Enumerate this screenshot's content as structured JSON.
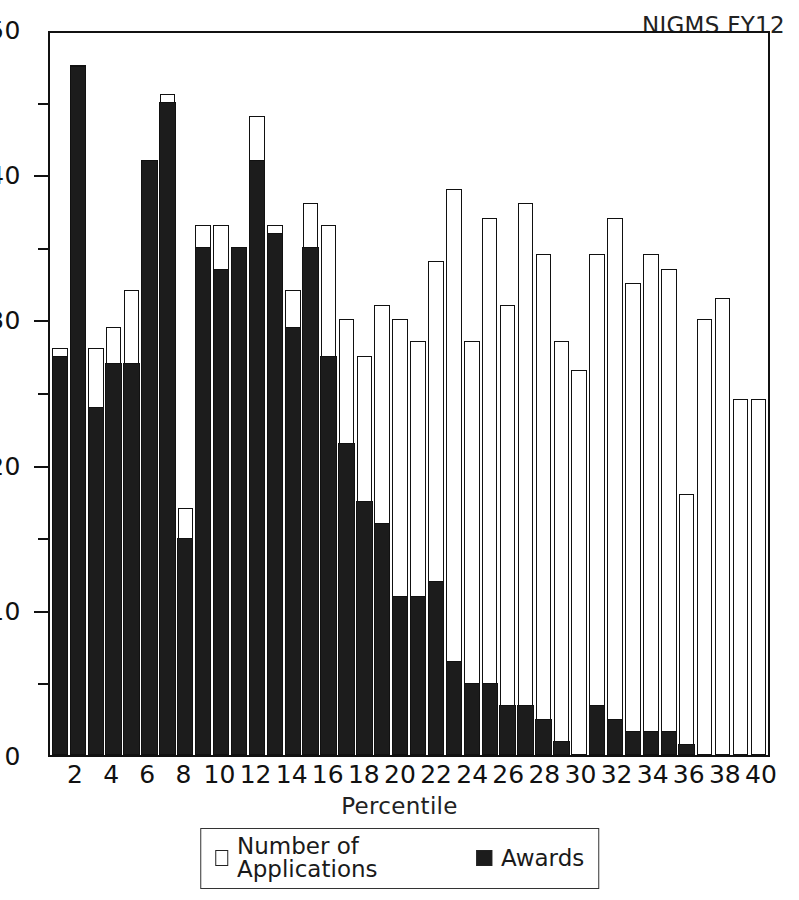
{
  "chart_data": {
    "type": "bar",
    "title": "NIGMS FY12",
    "xlabel": "Percentile",
    "ylabel": "",
    "ylim": [
      0,
      50
    ],
    "yticks": [
      0,
      10,
      20,
      30,
      40,
      50
    ],
    "yticks_minor": [
      5,
      15,
      25,
      35,
      45
    ],
    "grid": false,
    "stacked": true,
    "legend_position": "bottom",
    "xtick_labels": [
      "2",
      "4",
      "6",
      "8",
      "10",
      "12",
      "14",
      "16",
      "18",
      "20",
      "22",
      "24",
      "26",
      "28",
      "30",
      "32",
      "34",
      "36",
      "38",
      "40"
    ],
    "categories": [
      1,
      2,
      3,
      4,
      5,
      6,
      7,
      8,
      9,
      10,
      11,
      12,
      13,
      14,
      15,
      16,
      17,
      18,
      19,
      20,
      21,
      22,
      23,
      24,
      25,
      26,
      27,
      28,
      29,
      30,
      31,
      32,
      33,
      34,
      35,
      36,
      37,
      38,
      39,
      40
    ],
    "series": [
      {
        "name": "Number of Applications",
        "color": "#ffffff",
        "values": [
          28,
          47.5,
          28,
          29.5,
          32,
          41,
          45.5,
          17,
          36.5,
          36.5,
          35,
          44,
          36.5,
          32,
          38,
          36.5,
          30,
          27.5,
          31,
          30,
          28.5,
          34,
          39,
          28.5,
          37,
          31,
          38,
          34.5,
          28.5,
          26.5,
          34.5,
          37,
          32.5,
          34.5,
          33.5,
          18,
          30,
          31.5,
          24.5,
          24.5
        ]
      },
      {
        "name": "Awards",
        "color": "#1c1c1c",
        "values": [
          27.5,
          47.5,
          24,
          27,
          27,
          41,
          45,
          15,
          35,
          33.5,
          35,
          41,
          36,
          29.5,
          35,
          27.5,
          21.5,
          17.5,
          16,
          11,
          11,
          12,
          6.5,
          5,
          5,
          3.5,
          3.5,
          2.5,
          1,
          0,
          3.5,
          2.5,
          1.7,
          1.7,
          1.7,
          0.8,
          0,
          0,
          0,
          0
        ]
      }
    ],
    "legend_entries": [
      {
        "label": "Number of Applications",
        "swatch": "hollow"
      },
      {
        "label": "Awards",
        "swatch": "filled"
      }
    ]
  },
  "axis": {
    "y_labels": [
      "50",
      "40",
      "30",
      "20",
      "10",
      "0"
    ],
    "x_title": "Percentile"
  }
}
